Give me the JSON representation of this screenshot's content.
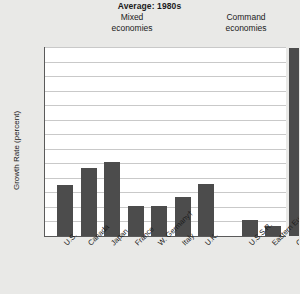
{
  "chart_data": {
    "type": "bar",
    "title": "Average: 1980s",
    "xlabel": "",
    "ylabel": "Growth Rate (percent)",
    "ylim": [
      0,
      13
    ],
    "y_ticks": [
      "0",
      "1",
      "2",
      "3",
      "4",
      "5",
      "6",
      "7",
      "8",
      "9",
      "10",
      "11",
      "12",
      "13%"
    ],
    "grid": true,
    "legend": "none",
    "bar_color": "#4c4c4c",
    "plot_background": "#ffffff",
    "figure_background": "#e9e9e7",
    "group_headers": [
      {
        "label": "Mixed\neconomies",
        "line1": "Mixed",
        "line2": "economies"
      },
      {
        "label": "Command\neconomies",
        "line1": "Command",
        "line2": "economies"
      }
    ],
    "categories": [
      "U.S.",
      "Canada",
      "Japan",
      "France",
      "W. Germany†",
      "Italy",
      "U.K.",
      "U.S.S.R.",
      "Eastern Europe",
      "China"
    ],
    "values": [
      3.5,
      4.7,
      5.1,
      2.1,
      2.1,
      2.7,
      3.6,
      1.1,
      0.7,
      13.0
    ],
    "groups": [
      {
        "name": "Mixed economies",
        "categories": [
          "U.S.",
          "Canada",
          "Japan",
          "France",
          "W. Germany†",
          "Italy",
          "U.K."
        ],
        "values": [
          3.5,
          4.7,
          5.1,
          2.1,
          2.1,
          2.7,
          3.6
        ]
      },
      {
        "name": "Command economies",
        "categories": [
          "U.S.S.R.",
          "Eastern Europe",
          "China"
        ],
        "values": [
          1.1,
          0.7,
          13.0
        ]
      }
    ]
  },
  "y_ticks": {
    "t0": "0",
    "t1": "1",
    "t2": "2",
    "t3": "3",
    "t4": "4",
    "t5": "5",
    "t6": "6",
    "t7": "7",
    "t8": "8",
    "t9": "9",
    "t10": "10",
    "t11": "11",
    "t12": "12",
    "t13": "13%"
  },
  "x_ticks": {
    "c0": "U.S.",
    "c1": "Canada",
    "c2": "Japan",
    "c3": "France",
    "c4": "W. Germany†",
    "c5": "Italy",
    "c6": "U.K.",
    "c7": "U.S.S.R.",
    "c8": "Eastern Europe",
    "c9": "China"
  },
  "headers": {
    "mixed_line1": "Mixed",
    "mixed_line2": "economies",
    "command_line1": "Command",
    "command_line2": "economies"
  }
}
